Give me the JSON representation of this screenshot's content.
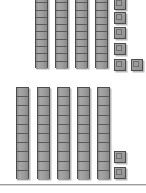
{
  "canvas": {
    "width": 146,
    "height": 193,
    "background": "#ffffff"
  },
  "colors": {
    "block_fill": "#9a9a9a",
    "block_outline": "#4d4d4d",
    "block_shadow": "#b9b9b9",
    "segment_line": "#5a5a5a",
    "divider_line": "#9d9d9d"
  },
  "manipulative": {
    "kind": "base-ten-blocks",
    "rod_segment_count": 10,
    "groups": [
      {
        "name": "top-group",
        "rod_count": 4,
        "cube_count": 6,
        "value": 46,
        "rods": [
          {
            "x": 35,
            "y": -5,
            "width": 13,
            "height": 73,
            "segments": 10
          },
          {
            "x": 55,
            "y": -5,
            "width": 13,
            "height": 73,
            "segments": 10
          },
          {
            "x": 75,
            "y": -5,
            "width": 13,
            "height": 73,
            "segments": 10
          },
          {
            "x": 95,
            "y": -5,
            "width": 13,
            "height": 73,
            "segments": 10
          }
        ],
        "cubes": [
          {
            "x": 114,
            "y": -2,
            "size": 12
          },
          {
            "x": 114,
            "y": 12,
            "size": 12
          },
          {
            "x": 114,
            "y": 27,
            "size": 12
          },
          {
            "x": 114,
            "y": 43,
            "size": 12
          },
          {
            "x": 114,
            "y": 59,
            "size": 12
          },
          {
            "x": 131,
            "y": 59,
            "size": 12
          }
        ]
      },
      {
        "name": "bottom-group",
        "rod_count": 5,
        "cube_count": 2,
        "value": 52,
        "rods": [
          {
            "x": 16,
            "y": 87,
            "width": 13,
            "height": 92,
            "segments": 10
          },
          {
            "x": 37,
            "y": 87,
            "width": 13,
            "height": 92,
            "segments": 10
          },
          {
            "x": 57,
            "y": 87,
            "width": 13,
            "height": 92,
            "segments": 10
          },
          {
            "x": 77,
            "y": 87,
            "width": 13,
            "height": 92,
            "segments": 10
          },
          {
            "x": 97,
            "y": 87,
            "width": 13,
            "height": 92,
            "segments": 10
          }
        ],
        "cubes": [
          {
            "x": 114,
            "y": 151,
            "size": 12
          },
          {
            "x": 114,
            "y": 167,
            "size": 12
          }
        ]
      }
    ]
  },
  "divider": {
    "y": 184,
    "color": "#9d9d9d"
  }
}
